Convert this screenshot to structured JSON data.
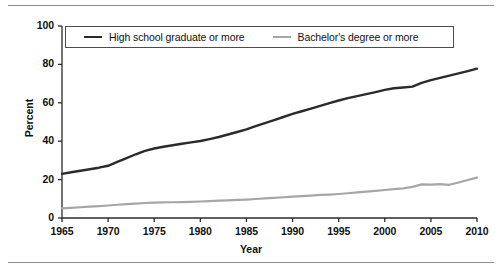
{
  "figure": {
    "has_top_rule": true,
    "has_bottom_rule": true,
    "rule_color": "#8c8c8c",
    "background": "#ffffff"
  },
  "legend": {
    "position": "top-inside",
    "entries": [
      {
        "label": "High school graduate or more",
        "color": "#2b2b2b",
        "icon": "line-swatch"
      },
      {
        "label": "Bachelor's degree or more",
        "color": "#a6a6a6",
        "icon": "line-swatch"
      }
    ]
  },
  "axes": {
    "y_title": "Percent",
    "x_title": "Year",
    "y_ticks": [
      "0",
      "20",
      "40",
      "60",
      "80",
      "100"
    ],
    "x_ticks": [
      "1965",
      "1970",
      "1975",
      "1980",
      "1985",
      "1990",
      "1995",
      "2000",
      "2005",
      "2010"
    ]
  },
  "chart_data": {
    "type": "line",
    "title": "",
    "subtitle": "",
    "xlabel": "Year",
    "ylabel": "Percent",
    "xlim": [
      1965,
      2010
    ],
    "ylim": [
      0,
      100
    ],
    "ytick_step": 20,
    "xtick_step": 5,
    "grid": false,
    "legend_position": "top-inside",
    "x": [
      1965,
      1966,
      1967,
      1968,
      1969,
      1970,
      1971,
      1972,
      1973,
      1974,
      1975,
      1976,
      1977,
      1978,
      1979,
      1980,
      1981,
      1982,
      1983,
      1984,
      1985,
      1986,
      1987,
      1988,
      1989,
      1990,
      1991,
      1992,
      1993,
      1994,
      1995,
      1996,
      1997,
      1998,
      1999,
      2000,
      2001,
      2002,
      2003,
      2004,
      2005,
      2006,
      2007,
      2008,
      2009,
      2010
    ],
    "series": [
      {
        "name": "High school graduate or more",
        "color": "#2b2b2b",
        "values": [
          23.0,
          23.8,
          24.6,
          25.4,
          26.2,
          27.2,
          29.2,
          31.2,
          33.2,
          35.0,
          36.2,
          37.1,
          37.9,
          38.7,
          39.4,
          40.1,
          41.1,
          42.2,
          43.5,
          44.8,
          46.2,
          47.8,
          49.4,
          51.0,
          52.6,
          54.2,
          55.6,
          57.0,
          58.4,
          59.8,
          61.2,
          62.4,
          63.5,
          64.5,
          65.6,
          66.7,
          67.6,
          68.0,
          68.4,
          70.4,
          71.8,
          73.0,
          74.2,
          75.3,
          76.5,
          77.8
        ]
      },
      {
        "name": "Bachelor's degree or more",
        "color": "#a6a6a6",
        "values": [
          5.0,
          5.3,
          5.6,
          5.9,
          6.2,
          6.5,
          6.9,
          7.2,
          7.5,
          7.8,
          8.0,
          8.1,
          8.2,
          8.3,
          8.4,
          8.6,
          8.8,
          9.0,
          9.2,
          9.4,
          9.6,
          9.9,
          10.2,
          10.5,
          10.8,
          11.1,
          11.4,
          11.7,
          12.0,
          12.2,
          12.5,
          12.9,
          13.3,
          13.7,
          14.1,
          14.6,
          15.0,
          15.4,
          16.2,
          17.5,
          17.4,
          17.6,
          17.3,
          18.5,
          19.8,
          21.0
        ]
      }
    ]
  }
}
